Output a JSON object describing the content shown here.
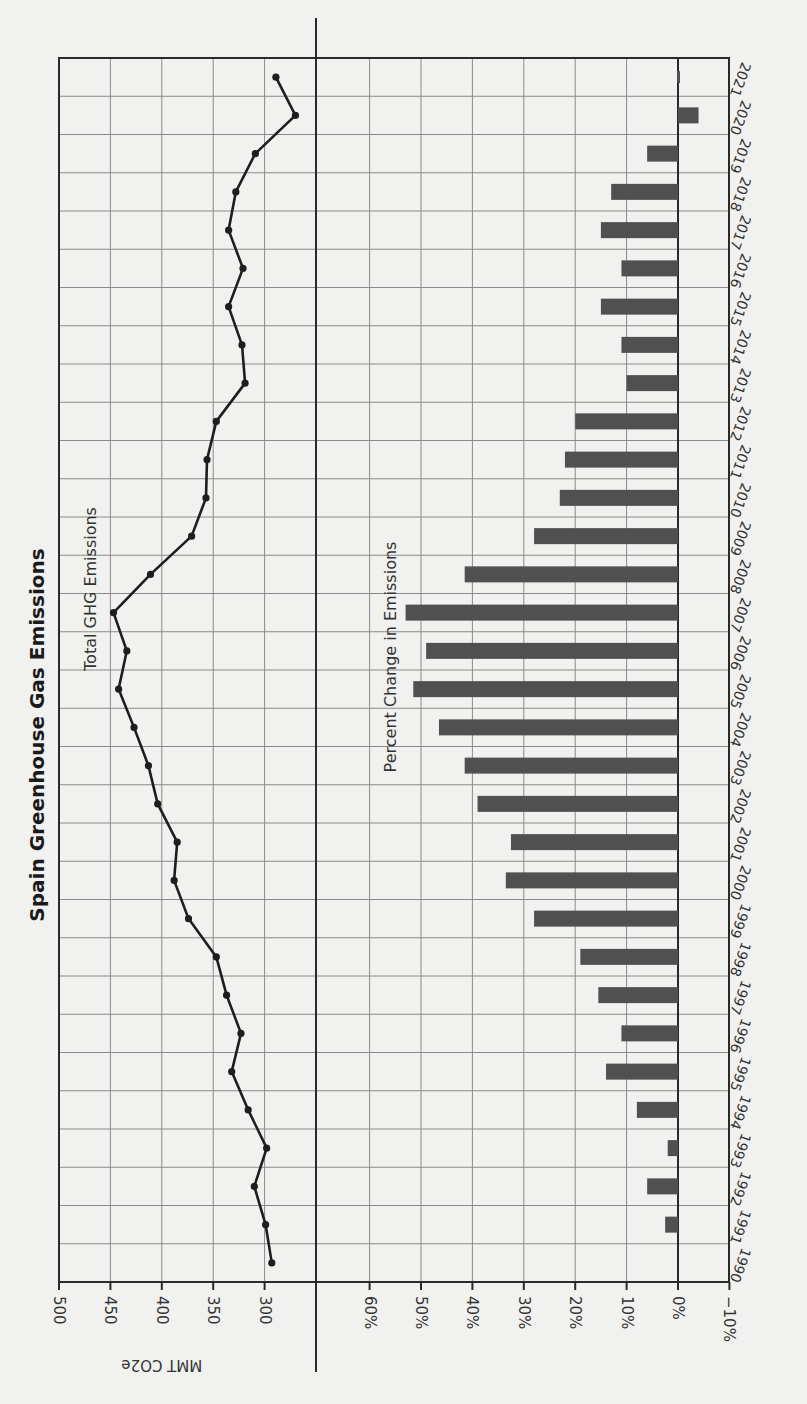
{
  "chart_data": {
    "title": "Spain Greenhouse Gas Emissions",
    "orientation": "rotated 90° clockwise (years run top-to-bottom, 2021 at top)",
    "years": [
      1990,
      1991,
      1992,
      1993,
      1994,
      1995,
      1996,
      1997,
      1998,
      1999,
      2000,
      2001,
      2002,
      2003,
      2004,
      2005,
      2006,
      2007,
      2008,
      2009,
      2010,
      2011,
      2012,
      2013,
      2014,
      2015,
      2016,
      2017,
      2018,
      2019,
      2020,
      2021
    ],
    "panels": [
      {
        "type": "line",
        "series_name": "Total GHG Emissions",
        "axis_label": "MMT CO2e",
        "ticks": [
          300,
          350,
          400,
          450,
          500
        ],
        "range": [
          250,
          500
        ],
        "values": [
          293,
          299,
          310,
          298,
          316,
          332,
          323,
          337,
          347,
          374,
          388,
          385,
          404,
          413,
          427,
          442,
          434,
          447,
          411,
          371,
          357,
          356,
          347,
          319,
          322,
          335,
          321,
          335,
          328,
          309,
          270,
          289
        ]
      },
      {
        "type": "bar",
        "series_name": "Percent Change in Emissions",
        "axis_label": "",
        "ticks": [
          "-10%",
          "0%",
          "10%",
          "20%",
          "30%",
          "40%",
          "50%",
          "60%"
        ],
        "range": [
          -10,
          70
        ],
        "values": [
          0,
          2.5,
          6,
          2,
          8,
          14,
          11,
          15.5,
          19,
          28,
          33.5,
          32.5,
          39,
          41.5,
          46.5,
          51.5,
          49,
          53,
          41.5,
          28,
          23,
          22,
          20,
          10,
          11,
          15,
          11,
          15,
          13,
          6,
          -4,
          0
        ]
      }
    ],
    "grid": true
  },
  "labels": {
    "title": "Spain Greenhouse Gas Emissions",
    "line_series": "Total GHG Emissions",
    "bar_series": "Percent Change in Emissions",
    "mmt_axis": "MMT CO2e",
    "mmt_ticks": [
      "500",
      "450",
      "400",
      "350",
      "300"
    ],
    "pct_ticks": [
      "60%",
      "50%",
      "40%",
      "30%",
      "20%",
      "10%",
      "0%",
      "−10%"
    ]
  },
  "colors": {
    "bar": "#505050",
    "line": "#1e1e1e",
    "grid": "#8a8a8a",
    "paper": "#f1f1ef"
  }
}
